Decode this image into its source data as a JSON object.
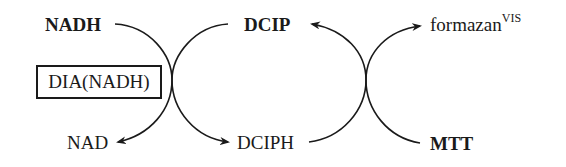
{
  "diagram": {
    "type": "coupled redox reaction scheme",
    "left_cycle": {
      "substrate": "NADH",
      "product": "NAD",
      "enzyme": "DIA(NADH)"
    },
    "middle": {
      "oxidized": "DCIP",
      "reduced": "DCIPH"
    },
    "right_cycle": {
      "substrate": "MTT",
      "product_base": "formazan",
      "product_superscript": "VIS"
    },
    "stroke_color": "#1a1a1a",
    "background": "#ffffff"
  }
}
